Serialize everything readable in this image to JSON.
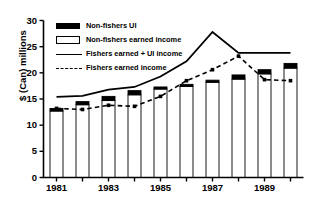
{
  "chart_data": {
    "type": "bar",
    "title": "",
    "xlabel": "",
    "ylabel": "$ (Can) millions",
    "ylim": [
      0,
      30
    ],
    "yticks": [
      0,
      5,
      10,
      15,
      20,
      25,
      30
    ],
    "ytick_labels": [
      "0",
      "5",
      "10",
      "15",
      "20",
      "25",
      "30"
    ],
    "xlim": [
      1980.5,
      1990.5
    ],
    "categories": [
      1981,
      1982,
      1983,
      1984,
      1985,
      1986,
      1987,
      1988,
      1989,
      1990
    ],
    "xtick_labels": [
      "1981",
      "",
      "1983",
      "",
      "1985",
      "",
      "1987",
      "",
      "1989",
      ""
    ],
    "grid": false,
    "legend_position": "upper-left",
    "series": [
      {
        "name": "Non-fishers earned income",
        "type": "bar-segment",
        "marker": "open-rectangle",
        "color": "#ffffff",
        "edge_color": "#000000",
        "values": [
          12.7,
          13.9,
          14.7,
          15.8,
          16.9,
          17.4,
          18.2,
          18.8,
          19.8,
          20.9
        ]
      },
      {
        "name": "Non-fishers UI",
        "type": "bar-segment",
        "marker": "filled-rectangle",
        "color": "#000000",
        "values": [
          0.5,
          0.6,
          0.8,
          0.8,
          0.4,
          0.4,
          0.4,
          0.8,
          0.8,
          0.9
        ],
        "totals": [
          13.2,
          14.5,
          15.5,
          16.6,
          17.3,
          17.8,
          18.6,
          19.6,
          20.6,
          21.8
        ]
      },
      {
        "name": "Fishers earned + UI income",
        "type": "line",
        "line_style": "solid",
        "color": "#000000",
        "values": [
          15.4,
          15.6,
          16.8,
          17.3,
          19.3,
          22.2,
          27.8,
          23.8,
          23.8,
          23.8
        ]
      },
      {
        "name": "Fishers earned income",
        "type": "line",
        "line_style": "dashed",
        "marker": "square",
        "color": "#000000",
        "values": [
          13.2,
          13.0,
          13.8,
          13.6,
          15.5,
          18.5,
          20.6,
          23.2,
          18.7,
          18.5
        ]
      }
    ]
  },
  "legend": {
    "items": [
      {
        "label": "Non-fishers UI",
        "swatch": "filled-rectangle"
      },
      {
        "label": "Non-fishers earned income",
        "swatch": "open-rectangle"
      },
      {
        "label": "Fishers earned + UI income",
        "swatch": "solid-line"
      },
      {
        "label": "Fishers earned income",
        "swatch": "dashed-line"
      }
    ]
  }
}
